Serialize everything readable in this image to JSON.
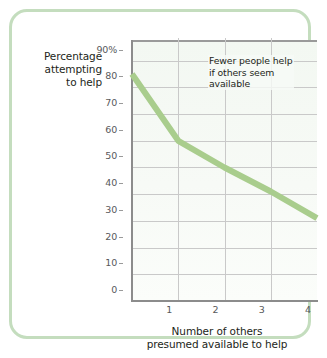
{
  "figure": {
    "frame_color": "#c4ddbe",
    "background_color": "#ffffff"
  },
  "annotation": {
    "line1": "Fewer people help",
    "line2": "if others seem",
    "line3": "available"
  },
  "y_axis_title": {
    "line1": "Percentage",
    "line2": "attempting",
    "line3": "to help"
  },
  "x_axis_title": {
    "line1": "Number of others",
    "line2": "presumed available to help"
  },
  "chart_data": {
    "type": "line",
    "title": "",
    "subtitle": "",
    "xlabel": "Number of others presumed available to help",
    "ylabel": "Percentage attempting to help",
    "x": [
      0,
      1,
      2,
      3,
      4
    ],
    "values": [
      85,
      60,
      50,
      41,
      31
    ],
    "series": [
      {
        "name": "Percentage attempting to help",
        "values": [
          85,
          60,
          50,
          41,
          31
        ],
        "color": "#a9cd8d",
        "line_width": 6
      }
    ],
    "xlim": [
      0,
      4
    ],
    "ylim": [
      0,
      97
    ],
    "xticks": [
      1,
      2,
      3,
      4
    ],
    "xtick_labels": [
      "1",
      "2",
      "3",
      "4"
    ],
    "yticks": [
      0,
      10,
      20,
      30,
      40,
      50,
      60,
      70,
      80,
      90
    ],
    "ytick_labels": [
      "0",
      "10",
      "20",
      "30",
      "40",
      "50",
      "60",
      "70",
      "80",
      "90%"
    ],
    "grid": true,
    "grid_color": "#c9c9c9",
    "legend": "none",
    "plot_background": "#f4f8f3",
    "annotations": [
      {
        "text": "Fewer people help if others seem available",
        "x": 2.1,
        "y": 90
      }
    ]
  }
}
